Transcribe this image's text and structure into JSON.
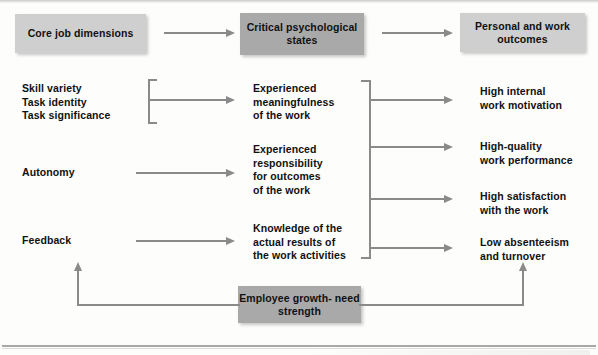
{
  "diagram": {
    "colors": {
      "box_light": "#cfcfcf",
      "box_dark": "#a9a9a9",
      "connector": "#8a8a8a",
      "text": "#111111",
      "background": "#fdfdfc"
    },
    "headers": [
      {
        "id": "core-job-dimensions",
        "label": "Core job\ndimensions",
        "shade": "light"
      },
      {
        "id": "critical-psychological-states",
        "label": "Critical\npsychological states",
        "shade": "dark"
      },
      {
        "id": "personal-and-work-outcomes",
        "label": "Personal and\nwork outcomes",
        "shade": "light"
      }
    ],
    "core_job_dimensions": [
      {
        "id": "skill-variety",
        "label": "Skill variety"
      },
      {
        "id": "task-identity",
        "label": "Task identity"
      },
      {
        "id": "task-significance",
        "label": "Task significance"
      },
      {
        "id": "autonomy",
        "label": "Autonomy"
      },
      {
        "id": "feedback",
        "label": "Feedback"
      }
    ],
    "core_job_dimensions_grouped_text": "Skill variety\nTask identity\nTask significance",
    "critical_psychological_states": [
      {
        "id": "experienced-meaningfulness",
        "label": "Experienced\nmeaningfulness\nof the work"
      },
      {
        "id": "experienced-responsibility",
        "label": "Experienced\nresponsibility\nfor outcomes\nof the work"
      },
      {
        "id": "knowledge-of-results",
        "label": "Knowledge of the\nactual results of\nthe work activities"
      }
    ],
    "personal_and_work_outcomes": [
      {
        "id": "high-internal-work-motivation",
        "label": "High internal\nwork motivation"
      },
      {
        "id": "high-quality-work-performance",
        "label": "High-quality\nwork performance"
      },
      {
        "id": "high-satisfaction-with-the-work",
        "label": "High satisfaction\nwith the work"
      },
      {
        "id": "low-absenteeism-and-turnover",
        "label": "Low absenteeism\nand turnover"
      }
    ],
    "moderator": {
      "id": "employee-growth-need-strength",
      "label": "Employee growth-\nneed strength",
      "shade": "dark"
    }
  }
}
